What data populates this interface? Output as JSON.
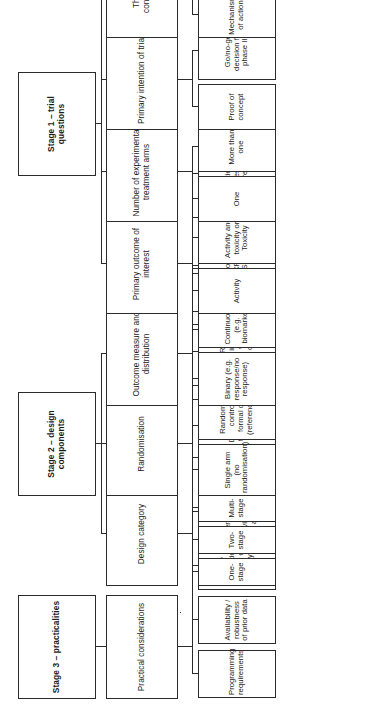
{
  "diagram": {
    "orientation": "rotated-90-ccw",
    "stages": [
      {
        "id": "stage-1",
        "label": "Stage 1 – trial questions",
        "categories": [
          {
            "id": "therapeutic-considerations",
            "label": "Therapeutic considerations",
            "items": [
              "Mechanism of action",
              "Aim of treatment",
              "Single or combination therapy",
              "Biomarker dependent (enrichment or endpoint)"
            ]
          },
          {
            "id": "primary-intention-of-trial",
            "label": "Primary intention of trial",
            "items": [
              "Proof of concept",
              "Go/no-go decision for phase III"
            ]
          },
          {
            "id": "number-of-experimental-treatment-arms",
            "label": "Number of experimental treatment arms",
            "items": [
              "One",
              "More than one"
            ]
          },
          {
            "id": "primary-outcome-of-interest",
            "label": "Primary outcome of interest",
            "items": [
              "Activity",
              "Activity and toxicity or Toxicity"
            ]
          }
        ]
      },
      {
        "id": "stage-2",
        "label": "Stage 2 – design components",
        "categories": [
          {
            "id": "outcome-measure-and-distribution",
            "label": "Outcome measure and distribution",
            "items": [
              "Binary (e.g. response/no response)",
              "Continuous (e.g. biomarker)",
              "Multinomial (e.g. CR vs. PR vs. SD/PD)",
              "Time-to-event",
              "Ratio of times to progression"
            ]
          },
          {
            "id": "randomisation",
            "label": "Randomisation",
            "items": [
              "Single arm (no randomisation)",
              "Randomisation incl. control, with no formal comparison (reference arm only)",
              "Randomisation incl. control, with formal comparison",
              "Randomisation to experimental arms (selection)"
            ]
          },
          {
            "id": "design-category",
            "label": "Design category",
            "items": [
              "One-stage",
              "Two-stage",
              "Multi-stage",
              "Continuous monitoring",
              "Decision-theoretic",
              "Three-outcome",
              "Phase II/III",
              "Randomised discontinuation",
              "Targeted subgroups"
            ]
          }
        ]
      },
      {
        "id": "stage-3",
        "label": "Stage 3 – practicalities",
        "categories": [
          {
            "id": "practical-considerations",
            "label": "Practical considerations",
            "items": [
              "Programming requirements",
              "Availability / robustness of prior data",
              "Early termination for lack of activity",
              "Early termination for evidence of activity",
              "Operating characteristics"
            ]
          }
        ]
      }
    ]
  },
  "colors": {
    "stroke": "#2b2b2b",
    "background": "#ffffff",
    "text": "#1a1a1a"
  }
}
